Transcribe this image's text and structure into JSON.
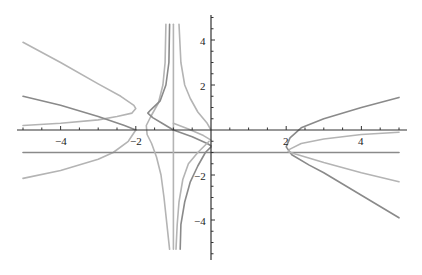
{
  "chart_data": {
    "type": "line",
    "title": "",
    "xlabel": "",
    "ylabel": "",
    "xlim": [
      -5,
      5
    ],
    "ylim": [
      -5.7,
      5.0
    ],
    "grid": false,
    "legend": null,
    "x_ticks": [
      {
        "value": -4,
        "label": "−4"
      },
      {
        "value": -2,
        "label": "−2"
      },
      {
        "value": 2,
        "label": "2"
      },
      {
        "value": 4,
        "label": "4"
      }
    ],
    "y_ticks": [
      {
        "value": 4,
        "label": "4"
      },
      {
        "value": 2,
        "label": "2"
      },
      {
        "value": -2,
        "label": "−2"
      },
      {
        "value": -4,
        "label": "−4"
      }
    ],
    "colors": {
      "dark": "#8a8a8a",
      "light": "#b4b4b4",
      "axis": "#333333"
    },
    "series": [
      {
        "name": "left-light-upper",
        "color": "light",
        "points": [
          [
            -5,
            3.9
          ],
          [
            -4,
            3.0
          ],
          [
            -3,
            2.05
          ],
          [
            -2.4,
            1.5
          ],
          [
            -2.05,
            1.1
          ],
          [
            -2.0,
            0.95
          ],
          [
            -2.1,
            0.75
          ],
          [
            -2.5,
            0.6
          ],
          [
            -3,
            0.45
          ],
          [
            -4,
            0.3
          ],
          [
            -5,
            0.2
          ]
        ]
      },
      {
        "name": "left-dark",
        "color": "dark",
        "points": [
          [
            -5,
            1.5
          ],
          [
            -4,
            1.1
          ],
          [
            -3,
            0.6
          ],
          [
            -2.3,
            0.2
          ],
          [
            -2.0,
            0.0
          ]
        ]
      },
      {
        "name": "left-light-lower",
        "color": "light",
        "points": [
          [
            -2.0,
            0.0
          ],
          [
            -2.2,
            -0.5
          ],
          [
            -2.6,
            -1.0
          ],
          [
            -3,
            -1.3
          ],
          [
            -4,
            -1.8
          ],
          [
            -5,
            -2.15
          ]
        ]
      },
      {
        "name": "horizontal-line",
        "color": "dark",
        "points": [
          [
            -5,
            -1.0
          ],
          [
            5,
            -1.0
          ]
        ]
      },
      {
        "name": "vertical-line",
        "color": "light",
        "points": [
          [
            -1,
            4.7
          ],
          [
            -1,
            -5.3
          ]
        ]
      },
      {
        "name": "center-light-left",
        "color": "light",
        "points": [
          [
            -1.2,
            4.7
          ],
          [
            -1.22,
            3.0
          ],
          [
            -1.28,
            2.0
          ],
          [
            -1.4,
            1.2
          ],
          [
            -1.6,
            0.6
          ],
          [
            -1.72,
            0.2
          ],
          [
            -1.7,
            -0.2
          ],
          [
            -1.58,
            -0.6
          ],
          [
            -1.45,
            -1.2
          ],
          [
            -1.33,
            -2.0
          ],
          [
            -1.25,
            -3.0
          ],
          [
            -1.1,
            -5.3
          ]
        ]
      },
      {
        "name": "center-dark-left",
        "color": "dark",
        "points": [
          [
            -1.1,
            4.7
          ],
          [
            -1.12,
            3.0
          ],
          [
            -1.2,
            2.0
          ],
          [
            -1.35,
            1.3
          ],
          [
            -1.6,
            0.9
          ],
          [
            -1.68,
            0.75
          ],
          [
            -1.55,
            0.55
          ],
          [
            -1.3,
            0.3
          ],
          [
            -1.0,
            0.0
          ],
          [
            -0.5,
            -0.3
          ],
          [
            -0.1,
            -0.6
          ],
          [
            0,
            -0.7
          ]
        ]
      },
      {
        "name": "center-light-right",
        "color": "light",
        "points": [
          [
            -0.85,
            4.7
          ],
          [
            -0.8,
            3.0
          ],
          [
            -0.7,
            2.0
          ],
          [
            -0.55,
            1.4
          ],
          [
            -0.35,
            0.8
          ],
          [
            -0.1,
            0.3
          ],
          [
            0,
            0.0
          ]
        ]
      },
      {
        "name": "center-light-right-lower",
        "color": "light",
        "points": [
          [
            -1.0,
            0.3
          ],
          [
            -0.6,
            0.05
          ],
          [
            -0.2,
            -0.25
          ],
          [
            0.0,
            -0.45
          ]
        ]
      },
      {
        "name": "center-dark-lower",
        "color": "dark",
        "points": [
          [
            0.0,
            -0.75
          ],
          [
            -0.15,
            -1.0
          ],
          [
            -0.35,
            -1.6
          ],
          [
            -0.55,
            -2.3
          ],
          [
            -0.7,
            -3.2
          ],
          [
            -0.8,
            -4.2
          ],
          [
            -0.82,
            -5.3
          ]
        ]
      },
      {
        "name": "center-light-lower",
        "color": "light",
        "points": [
          [
            -0.05,
            -0.5
          ],
          [
            -0.35,
            -1.0
          ],
          [
            -0.6,
            -1.5
          ],
          [
            -0.75,
            -2.2
          ],
          [
            -0.85,
            -3.2
          ],
          [
            -0.9,
            -4.2
          ],
          [
            -0.93,
            -5.3
          ]
        ]
      },
      {
        "name": "right-dark",
        "color": "dark",
        "points": [
          [
            5,
            1.45
          ],
          [
            4,
            1.0
          ],
          [
            3,
            0.5
          ],
          [
            2.4,
            0.1
          ],
          [
            2.1,
            -0.35
          ],
          [
            2.0,
            -0.75
          ],
          [
            2.15,
            -1.1
          ],
          [
            2.6,
            -1.55
          ],
          [
            3,
            -1.9
          ],
          [
            4,
            -2.9
          ],
          [
            5,
            -3.9
          ]
        ]
      },
      {
        "name": "right-light",
        "color": "light",
        "points": [
          [
            5,
            -0.1
          ],
          [
            4,
            -0.2
          ],
          [
            3,
            -0.4
          ],
          [
            2.4,
            -0.6
          ],
          [
            2.1,
            -0.85
          ],
          [
            2.05,
            -0.95
          ],
          [
            2.2,
            -1.05
          ],
          [
            2.6,
            -1.25
          ],
          [
            3,
            -1.45
          ],
          [
            4,
            -1.9
          ],
          [
            5,
            -2.3
          ]
        ]
      }
    ]
  }
}
